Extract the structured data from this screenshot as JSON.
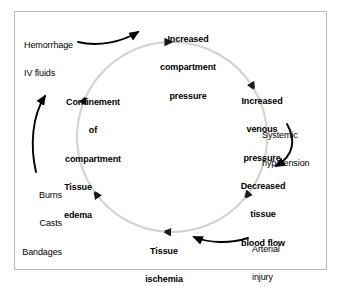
{
  "figure": {
    "frame_color": "#b9b7ad",
    "background": "#ffffff",
    "cycle_color": "#d4d2cc",
    "arrow_color": "#000000",
    "text_color": "#000000"
  },
  "cycle": {
    "direction": "clockwise",
    "center_x": 172,
    "center_y": 137,
    "radius": 95,
    "nodes": [
      {
        "id": "increased-compartment-pressure",
        "lines": [
          "Increased",
          "compartment",
          "pressure"
        ],
        "text": "Increased compartment pressure",
        "position": "top",
        "x": 188,
        "y": 16
      },
      {
        "id": "increased-venous-pressure",
        "lines": [
          "Increased",
          "venous",
          "pressure"
        ],
        "text": "Increased venous pressure",
        "position": "right-upper",
        "x": 262,
        "y": 78
      },
      {
        "id": "decreased-tissue-blood-flow",
        "lines": [
          "Decreased",
          "tissue",
          "blood flow"
        ],
        "text": "Decreased tissue blood flow",
        "position": "right-lower",
        "x": 263,
        "y": 163
      },
      {
        "id": "tissue-ischemia",
        "lines": [
          "Tissue",
          "ischemia"
        ],
        "text": "Tissue ischemia",
        "position": "bottom",
        "x": 164,
        "y": 228
      },
      {
        "id": "tissue-edema",
        "lines": [
          "Tissue",
          "edema"
        ],
        "text": "Tissue edema",
        "position": "left-lower",
        "x": 78,
        "y": 164
      },
      {
        "id": "confinement-of-compartment",
        "lines": [
          "Confinement",
          "of",
          "compartment"
        ],
        "text": "Confinement of compartment",
        "position": "left-upper",
        "x": 93,
        "y": 79
      }
    ]
  },
  "factors": [
    {
      "id": "hemorrhage-iv-fluids",
      "lines": [
        "Hemorrhage",
        "IV fluids"
      ],
      "text": "Hemorrhage IV fluids",
      "targets": "increased-compartment-pressure",
      "x": 24,
      "y": 22,
      "align": "left"
    },
    {
      "id": "systemic-hypotension",
      "lines": [
        "Systemic",
        "hypotension"
      ],
      "text": "Systemic hypotension",
      "targets": "decreased-tissue-blood-flow",
      "x": 262,
      "y": 112,
      "align": "left"
    },
    {
      "id": "arterial-injury",
      "lines": [
        "Arterial",
        "injury"
      ],
      "text": "Arterial injury",
      "targets": "tissue-ischemia",
      "x": 252,
      "y": 226,
      "align": "left"
    },
    {
      "id": "burns-casts-bandages",
      "lines": [
        "Burns",
        "Casts",
        "Bandages"
      ],
      "text": "Burns Casts Bandages",
      "targets": "confinement-of-compartment",
      "x": 62,
      "y": 172,
      "align": "right"
    }
  ]
}
